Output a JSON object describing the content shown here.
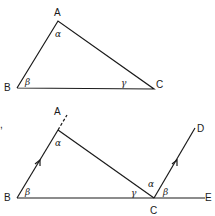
{
  "figure1": {
    "vertices": {
      "A": "A",
      "B": "B",
      "C": "C"
    },
    "angles": {
      "at_A": "α",
      "at_B": "β",
      "at_C": "γ"
    }
  },
  "figure2": {
    "vertices": {
      "A": "A",
      "B": "B",
      "C": "C",
      "D": "D",
      "E": "E"
    },
    "angles": {
      "at_A": "α",
      "at_B": "β",
      "at_C_inner": "γ",
      "at_C_alpha": "α",
      "at_C_beta": "β"
    },
    "stray_mark": ","
  },
  "colors": {
    "ink": "#1a1a1a",
    "background": "#ffffff"
  }
}
